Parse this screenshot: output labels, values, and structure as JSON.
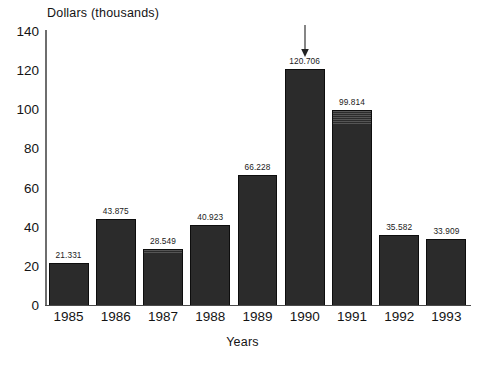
{
  "chart_data": {
    "type": "bar",
    "title": "",
    "ylabel": "Dollars  (thousands)",
    "xlabel": "Years",
    "categories": [
      "1985",
      "1986",
      "1987",
      "1988",
      "1989",
      "1990",
      "1991",
      "1992",
      "1993"
    ],
    "values": [
      21.331,
      43.875,
      28.549,
      40.923,
      66.228,
      120.706,
      99.814,
      35.582,
      33.909
    ],
    "value_labels": [
      "21.331",
      "43.875",
      "28.549",
      "40.923",
      "66.228",
      "120.706",
      "99.814",
      "35.582",
      "33.909"
    ],
    "ylim": [
      0,
      140
    ],
    "yticks": [
      0,
      20,
      40,
      60,
      80,
      100,
      120,
      140
    ],
    "ytick_labels": [
      "0",
      "20",
      "40",
      "60",
      "80",
      "100",
      "120",
      "140"
    ],
    "grid": false,
    "legend": null,
    "bar_color": "#2b2b2b",
    "annotations": [
      {
        "name": "arrow-1990",
        "kind": "down-arrow",
        "target_category": "1990",
        "target_value_label": "120.706"
      }
    ]
  }
}
